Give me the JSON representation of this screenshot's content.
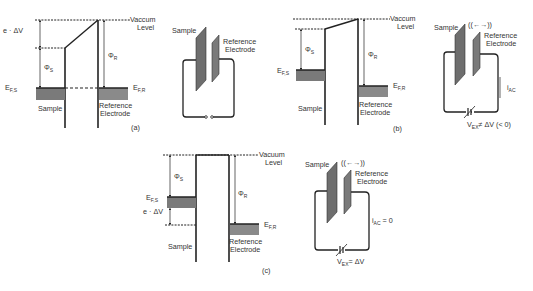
{
  "figure": {
    "panels": [
      {
        "id": "a",
        "caption": "(a)",
        "band_diagram": {
          "vacuum_label_line1": "Vaccum",
          "vacuum_label_line2": "Level",
          "delta_v_label": "e · ΔV",
          "phi_s_label": "Φ",
          "phi_s_sub": "S",
          "phi_r_label": "Φ",
          "phi_r_sub": "R",
          "ef_s_label": "E",
          "ef_s_sub": "F,S",
          "ef_r_label": "E",
          "ef_r_sub": "F,R",
          "sample_label": "Sample",
          "ref_label_line1": "Reference",
          "ref_label_line2": "Electrode"
        },
        "circuit": {
          "sample_label": "Sample",
          "ref_label_line1": "Reference",
          "ref_label_line2": "Electrode",
          "state": "open switch"
        }
      },
      {
        "id": "b",
        "caption": "(b)",
        "band_diagram": {
          "vacuum_label_line1": "Vaccum",
          "vacuum_label_line2": "Level",
          "phi_s_label": "Φ",
          "phi_s_sub": "S",
          "phi_r_label": "Φ",
          "phi_r_sub": "R",
          "ef_s_label": "E",
          "ef_s_sub": "F,S",
          "ef_r_label": "E",
          "ef_r_sub": "F,R",
          "sample_label": "Sample",
          "ref_label_line1": "Reference",
          "ref_label_line2": "Electrode"
        },
        "circuit": {
          "sample_label": "Sample",
          "vibration_label": "((←→))",
          "ref_label_line1": "Reference",
          "ref_label_line2": "Electrode",
          "current_label": "i",
          "current_sub": "AC",
          "current_value": "",
          "vex_label": "V",
          "vex_sub": "EX",
          "vex_relation": "≠ ΔV (< 0)"
        }
      },
      {
        "id": "c",
        "caption": "(c)",
        "band_diagram": {
          "vacuum_label_line1": "Vacuum",
          "vacuum_label_line2": "Level",
          "delta_v_label": "e · ΔV",
          "phi_s_label": "Φ",
          "phi_s_sub": "S",
          "phi_r_label": "Φ",
          "phi_r_sub": "R",
          "ef_s_label": "E",
          "ef_s_sub": "F,S",
          "ef_r_label": "E",
          "ef_r_sub": "F,R",
          "sample_label": "Sample",
          "ref_label_line1": "Reference",
          "ref_label_line2": "Electrode"
        },
        "circuit": {
          "sample_label": "Sample",
          "vibration_label": "((←→))",
          "ref_label_line1": "Reference",
          "ref_label_line2": "Electrode",
          "current_label": "i",
          "current_sub": "AC",
          "current_value": " = 0",
          "vex_label": "V",
          "vex_sub": "EX",
          "vex_relation": "=  ΔV"
        }
      }
    ]
  },
  "colors": {
    "line": "#222222",
    "plate_fill": "#6e6e6e",
    "band_fill": "#8a8a8a",
    "text": "#333333"
  }
}
